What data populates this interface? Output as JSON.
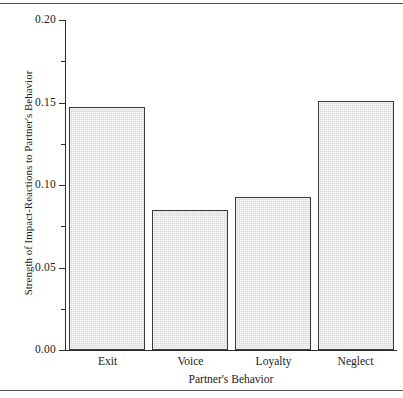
{
  "chart_data": {
    "type": "bar",
    "title": "",
    "xlabel": "Partner's Behavior",
    "ylabel": "Strength of Impact-Reactions to Partner's Behavior",
    "categories": [
      "Exit",
      "Voice",
      "Loyalty",
      "Neglect"
    ],
    "values": [
      0.147,
      0.085,
      0.093,
      0.151
    ],
    "ylim": [
      0.0,
      0.2
    ],
    "y_major_ticks": [
      0.0,
      0.05,
      0.1,
      0.15,
      0.2
    ],
    "y_tick_labels": [
      "0.00",
      "0.05",
      "0.10",
      "0.15",
      "0.20"
    ],
    "y_minor_ticks": [
      0.025,
      0.075,
      0.125,
      0.175
    ],
    "grid": false,
    "legend": null,
    "legend_position": "none",
    "bar_fill_color": "#d9d9d9",
    "bar_edge_color": "#3a3a3a",
    "axis_color": "#2b2b2b"
  },
  "figure": {
    "rule_top_label": "top-divider-rule",
    "rule_bottom_label": "bottom-divider-rule",
    "rule_color": "#555555"
  }
}
